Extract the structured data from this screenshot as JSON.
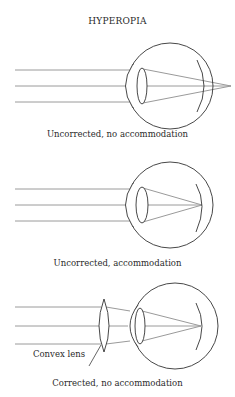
{
  "title": "HYPEROPIA",
  "panels": [
    {
      "caption": "Uncorrected, no accommodation",
      "focus": "behind retina"
    },
    {
      "caption": "Uncorrected, accommodation",
      "focus": "on retina"
    },
    {
      "caption": "Corrected, no accommodation",
      "focus": "on retina",
      "label": "Convex lens"
    }
  ],
  "colors": {
    "outline": "#333333",
    "ray": "#9a9a9a",
    "text": "#2a2a2a"
  }
}
